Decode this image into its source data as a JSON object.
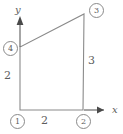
{
  "figure": {
    "kind": "quadrilateral-element-diagram",
    "background_color": "#ffffff",
    "line_color": "#8a8a8a",
    "text_color": "#5d5d5d",
    "axes": {
      "x_label": "x",
      "y_label": "y",
      "x_arrow_icon": "arrow-right-icon",
      "y_arrow_icon": "arrow-up-icon"
    },
    "nodes": [
      {
        "id": "1",
        "label": "1",
        "position": "bottom-left"
      },
      {
        "id": "2",
        "label": "2",
        "position": "bottom-right"
      },
      {
        "id": "3",
        "label": "3",
        "position": "top-right"
      },
      {
        "id": "4",
        "label": "4",
        "position": "left"
      }
    ],
    "dimensions": [
      {
        "id": "bottom",
        "label": "2",
        "edge": "node-1-to-node-2"
      },
      {
        "id": "left",
        "label": "2",
        "edge": "node-1-to-node-4"
      },
      {
        "id": "right",
        "label": "3",
        "edge": "node-2-to-node-3"
      }
    ]
  }
}
